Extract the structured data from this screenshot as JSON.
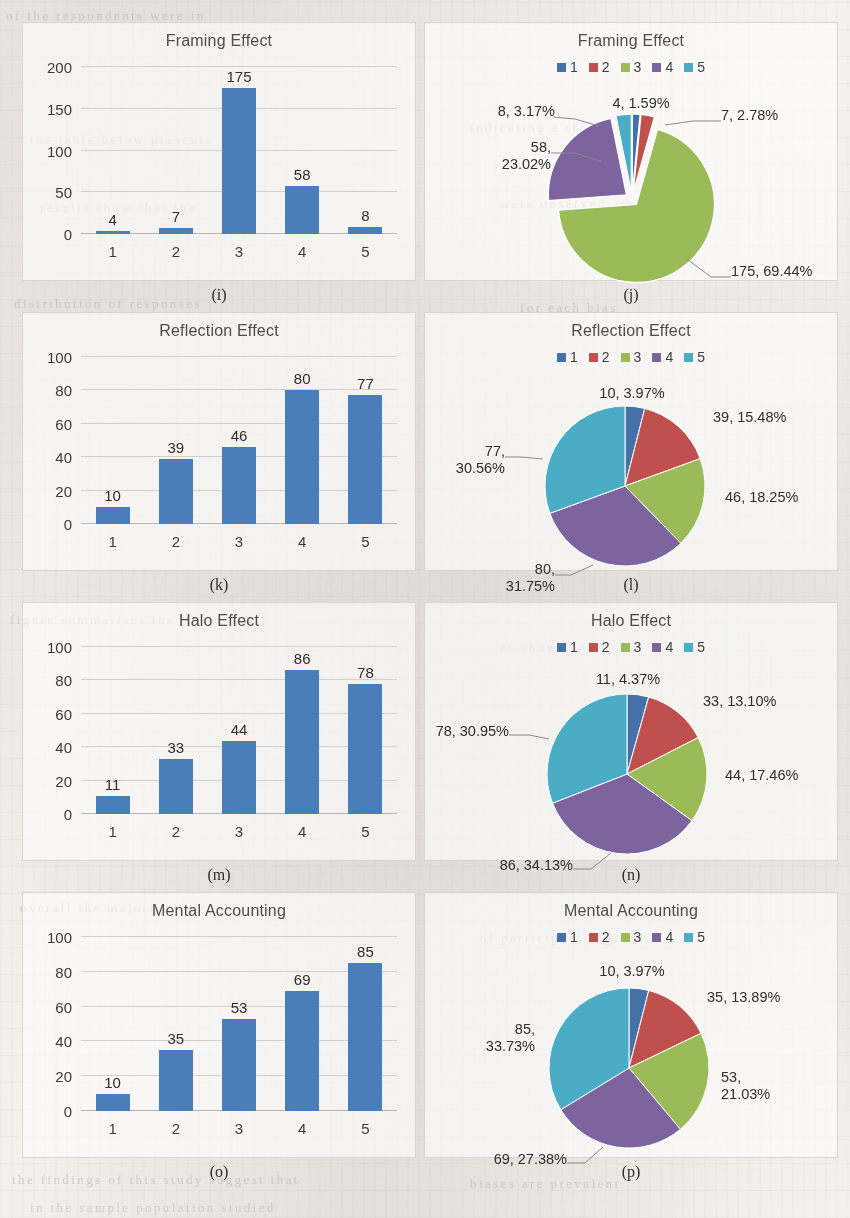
{
  "palette": {
    "bar": "#4a7ebb",
    "s1": "#4472a8",
    "s2": "#c0504d",
    "s3": "#9bbb59",
    "s4": "#7e649f",
    "s5": "#4bacc6",
    "gridline": "#d3d0cb",
    "panel_border": "#d8d5d0",
    "paper": "#f4f2ee"
  },
  "legend_labels": [
    "1",
    "2",
    "3",
    "4",
    "5"
  ],
  "ghost_text": [
    {
      "x": 6,
      "y": 8,
      "t": "of the  respondents  were  in"
    },
    {
      "x": 470,
      "y": 120,
      "t": "indicating  a  strong"
    },
    {
      "x": 30,
      "y": 132,
      "t": "the  table  below  presents"
    },
    {
      "x": 500,
      "y": 196,
      "t": "were  observed  among"
    },
    {
      "x": 40,
      "y": 200,
      "t": "results  show  that  the"
    },
    {
      "x": 14,
      "y": 296,
      "t": "distribution  of  responses"
    },
    {
      "x": 520,
      "y": 300,
      "t": "for  each  bias"
    },
    {
      "x": 10,
      "y": 612,
      "t": "figure  summarises  the"
    },
    {
      "x": 500,
      "y": 640,
      "t": "as  shown  in"
    },
    {
      "x": 20,
      "y": 900,
      "t": "overall  the  majority"
    },
    {
      "x": 480,
      "y": 930,
      "t": "of  participants  agreed"
    },
    {
      "x": 12,
      "y": 1172,
      "t": "the  findings  of  this  study  suggest  that"
    },
    {
      "x": 470,
      "y": 1176,
      "t": "biases  are  prevalent"
    },
    {
      "x": 30,
      "y": 1200,
      "t": "in  the  sample  population  studied"
    }
  ],
  "panels": [
    {
      "id": "framing-bar",
      "kind": "bar",
      "caption": "(i)",
      "chart_data": {
        "type": "bar",
        "title": "Framing Effect",
        "categories": [
          "1",
          "2",
          "3",
          "4",
          "5"
        ],
        "values": [
          4,
          7,
          175,
          58,
          8
        ],
        "xlabel": "",
        "ylabel": "",
        "ylim": [
          0,
          200
        ],
        "yticks": [
          0,
          50,
          100,
          150,
          200
        ],
        "grid": true,
        "series_color": "#4a7ebb"
      }
    },
    {
      "id": "framing-pie",
      "kind": "pie",
      "caption": "(j)",
      "chart_data": {
        "type": "pie",
        "title": "Framing Effect",
        "legend": [
          "1",
          "2",
          "3",
          "4",
          "5"
        ],
        "legend_position": "top",
        "exploded": true,
        "labels": [
          "1",
          "2",
          "3",
          "4",
          "5"
        ],
        "values": [
          4,
          7,
          175,
          58,
          8
        ],
        "percents": [
          "1.59%",
          "2.78%",
          "69.44%",
          "23.02%",
          "3.17%"
        ],
        "data_labels": [
          "4, 1.59%",
          "7, 2.78%",
          "175, 69.44%",
          "58, 23.02%",
          "8, 3.17%"
        ],
        "colors": [
          "#4472a8",
          "#c0504d",
          "#9bbb59",
          "#7e649f",
          "#4bacc6"
        ]
      },
      "label_text": {
        "l1": "4, 1.59%",
        "l2": "7, 2.78%",
        "l3": "175, 69.44%",
        "l4a": "58,",
        "l4b": "23.02%",
        "l5": "8, 3.17%"
      }
    },
    {
      "id": "reflection-bar",
      "kind": "bar",
      "caption": "(k)",
      "chart_data": {
        "type": "bar",
        "title": "Reflection Effect",
        "categories": [
          "1",
          "2",
          "3",
          "4",
          "5"
        ],
        "values": [
          10,
          39,
          46,
          80,
          77
        ],
        "xlabel": "",
        "ylabel": "",
        "ylim": [
          0,
          100
        ],
        "yticks": [
          0,
          20,
          40,
          60,
          80,
          100
        ],
        "grid": true,
        "series_color": "#4a7ebb"
      }
    },
    {
      "id": "reflection-pie",
      "kind": "pie",
      "caption": "(l)",
      "chart_data": {
        "type": "pie",
        "title": "Reflection Effect",
        "legend": [
          "1",
          "2",
          "3",
          "4",
          "5"
        ],
        "legend_position": "top",
        "exploded": false,
        "labels": [
          "1",
          "2",
          "3",
          "4",
          "5"
        ],
        "values": [
          10,
          39,
          46,
          80,
          77
        ],
        "percents": [
          "3.97%",
          "15.48%",
          "18.25%",
          "31.75%",
          "30.56%"
        ],
        "data_labels": [
          "10, 3.97%",
          "39, 15.48%",
          "46, 18.25%",
          "80, 31.75%",
          "77, 30.56%"
        ],
        "colors": [
          "#4472a8",
          "#c0504d",
          "#9bbb59",
          "#7e649f",
          "#4bacc6"
        ]
      },
      "label_text": {
        "l1": "10, 3.97%",
        "l2": "39, 15.48%",
        "l3": "46, 18.25%",
        "l4a": "80,",
        "l4b": "31.75%",
        "l5a": "77,",
        "l5b": "30.56%"
      }
    },
    {
      "id": "halo-bar",
      "kind": "bar",
      "caption": "(m)",
      "chart_data": {
        "type": "bar",
        "title": "Halo Effect",
        "categories": [
          "1",
          "2",
          "3",
          "4",
          "5"
        ],
        "values": [
          11,
          33,
          44,
          86,
          78
        ],
        "xlabel": "",
        "ylabel": "",
        "ylim": [
          0,
          100
        ],
        "yticks": [
          0,
          20,
          40,
          60,
          80,
          100
        ],
        "grid": true,
        "series_color": "#4a7ebb"
      }
    },
    {
      "id": "halo-pie",
      "kind": "pie",
      "caption": "(n)",
      "chart_data": {
        "type": "pie",
        "title": "Halo Effect",
        "legend": [
          "1",
          "2",
          "3",
          "4",
          "5"
        ],
        "legend_position": "top",
        "exploded": false,
        "labels": [
          "1",
          "2",
          "3",
          "4",
          "5"
        ],
        "values": [
          11,
          33,
          44,
          86,
          78
        ],
        "percents": [
          "4.37%",
          "13.10%",
          "17.46%",
          "34.13%",
          "30.95%"
        ],
        "data_labels": [
          "11, 4.37%",
          "33, 13.10%",
          "44, 17.46%",
          "86, 34.13%",
          "78, 30.95%"
        ],
        "colors": [
          "#4472a8",
          "#c0504d",
          "#9bbb59",
          "#7e649f",
          "#4bacc6"
        ]
      },
      "label_text": {
        "l1": "11, 4.37%",
        "l2": "33, 13.10%",
        "l3": "44, 17.46%",
        "l4": "86, 34.13%",
        "l5": "78, 30.95%"
      }
    },
    {
      "id": "mental-bar",
      "kind": "bar",
      "caption": "(o)",
      "chart_data": {
        "type": "bar",
        "title": "Mental Accounting",
        "categories": [
          "1",
          "2",
          "3",
          "4",
          "5"
        ],
        "values": [
          10,
          35,
          53,
          69,
          85
        ],
        "xlabel": "",
        "ylabel": "",
        "ylim": [
          0,
          100
        ],
        "yticks": [
          0,
          20,
          40,
          60,
          80,
          100
        ],
        "grid": true,
        "series_color": "#4a7ebb"
      }
    },
    {
      "id": "mental-pie",
      "kind": "pie",
      "caption": "(p)",
      "chart_data": {
        "type": "pie",
        "title": "Mental Accounting",
        "legend": [
          "1",
          "2",
          "3",
          "4",
          "5"
        ],
        "legend_position": "top",
        "exploded": false,
        "labels": [
          "1",
          "2",
          "3",
          "4",
          "5"
        ],
        "values": [
          10,
          35,
          53,
          69,
          85
        ],
        "percents": [
          "3.97%",
          "13.89%",
          "21.03%",
          "27.38%",
          "33.73%"
        ],
        "data_labels": [
          "10, 3.97%",
          "35, 13.89%",
          "53, 21.03%",
          "69, 27.38%",
          "85, 33.73%"
        ],
        "colors": [
          "#4472a8",
          "#c0504d",
          "#9bbb59",
          "#7e649f",
          "#4bacc6"
        ]
      },
      "label_text": {
        "l1": "10, 3.97%",
        "l2": "35, 13.89%",
        "l3a": "53,",
        "l3b": "21.03%",
        "l4": "69, 27.38%",
        "l5a": "85,",
        "l5b": "33.73%"
      }
    }
  ]
}
